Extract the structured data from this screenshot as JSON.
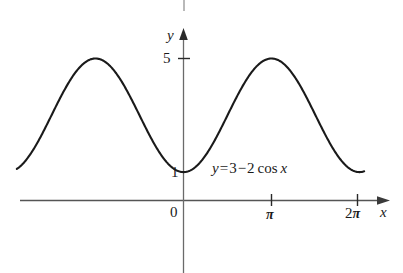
{
  "figure": {
    "width": 403,
    "height": 273,
    "background": "#ffffff",
    "ink_color": "#1a1a1a",
    "axis_color": "#4a4a4a"
  },
  "axes": {
    "y_axis_label": "y",
    "x_axis_label": "x",
    "origin_label": "0",
    "y_ticks": [
      {
        "value": 5,
        "label": "5"
      },
      {
        "value": 1,
        "label": "1"
      }
    ],
    "x_ticks": [
      {
        "value": 0,
        "label": "0"
      },
      {
        "value": 3.14159,
        "label": "π",
        "prefix": ""
      },
      {
        "value": 6.28319,
        "label": "π",
        "prefix": "2"
      }
    ]
  },
  "annotation": {
    "equation_y": "y",
    "equation_equals": "=",
    "equation_three": "3",
    "equation_minus": "−",
    "equation_two": "2",
    "equation_cos": "cos",
    "equation_x": "x",
    "equation_full": "y = 3 − 2 cos x"
  },
  "chart_data": {
    "type": "line",
    "title": "",
    "subtitle": "",
    "xlabel": "x",
    "ylabel": "y",
    "grid": false,
    "legend": "none",
    "annotations": [
      {
        "text": "y = 3 − 2 cos x",
        "x": 1.2,
        "y": 1.35
      }
    ],
    "xlim": [
      -6.0,
      6.5
    ],
    "ylim": [
      -1.6,
      5.9
    ],
    "x_tick_values": [
      0,
      3.14159,
      6.28319
    ],
    "x_tick_labels": [
      "0",
      "π",
      "2π"
    ],
    "y_tick_values": [
      1,
      5
    ],
    "y_tick_labels": [
      "1",
      "5"
    ],
    "series": [
      {
        "name": "y = 3 - 2 cos x",
        "expression": "3 - 2*cos(x)",
        "color": "#1a1a1a",
        "x_start": -5.95,
        "x_end": 6.45,
        "amplitude": 2,
        "vertical_shift": 3,
        "period": 6.28319,
        "minima": [
          {
            "x": 0,
            "y": 1
          },
          {
            "x": 6.28319,
            "y": 1
          }
        ],
        "maxima": [
          {
            "x": -3.14159,
            "y": 5
          },
          {
            "x": 3.14159,
            "y": 5
          }
        ],
        "x": [
          -5.95,
          -5.6,
          -5.2,
          -4.8,
          -4.4,
          -4.0,
          -3.6,
          -3.2,
          -3.14159,
          -2.8,
          -2.4,
          -2.0,
          -1.6,
          -1.2,
          -0.8,
          -0.4,
          0,
          0.4,
          0.8,
          1.2,
          1.6,
          2.0,
          2.4,
          2.8,
          3.14159,
          3.6,
          4.0,
          4.4,
          4.8,
          5.2,
          5.6,
          6.0,
          6.28319,
          6.45
        ],
        "y": [
          1.13,
          1.46,
          2.11,
          2.82,
          3.61,
          4.31,
          4.78,
          5.0,
          5.0,
          4.89,
          4.48,
          3.83,
          3.06,
          2.28,
          1.61,
          1.16,
          1.0,
          1.16,
          1.61,
          2.28,
          3.06,
          3.83,
          4.48,
          4.89,
          5.0,
          4.78,
          4.31,
          3.61,
          2.82,
          2.11,
          1.46,
          1.08,
          1.0,
          1.02
        ]
      }
    ]
  }
}
